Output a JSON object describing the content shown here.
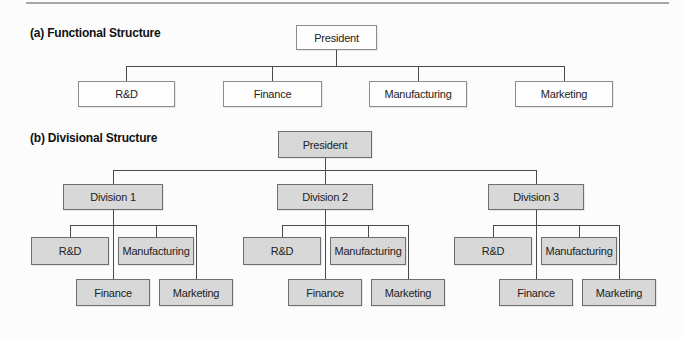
{
  "colors": {
    "page_bg": "#fcfcfc",
    "rule": "#a6a6a6",
    "line": "#4a4a4a",
    "heading_text": "#111111",
    "node_text": "#222222",
    "box_white_fill": "#fefefe",
    "box_white_border": "#8c8c8c",
    "box_gray_fill": "#d8d8d8",
    "box_gray_border": "#6e6e6e"
  },
  "section_a": {
    "heading": "(a) Functional Structure",
    "president": "President",
    "children": [
      "R&D",
      "Finance",
      "Manufacturing",
      "Marketing"
    ]
  },
  "section_b": {
    "heading": "(b) Divisional Structure",
    "president": "President",
    "divisions": [
      {
        "label": "Division 1",
        "children": [
          "R&D",
          "Manufacturing",
          "Finance",
          "Marketing"
        ]
      },
      {
        "label": "Division 2",
        "children": [
          "R&D",
          "Manufacturing",
          "Finance",
          "Marketing"
        ]
      },
      {
        "label": "Division 3",
        "children": [
          "R&D",
          "Manufacturing",
          "Finance",
          "Marketing"
        ]
      }
    ]
  }
}
